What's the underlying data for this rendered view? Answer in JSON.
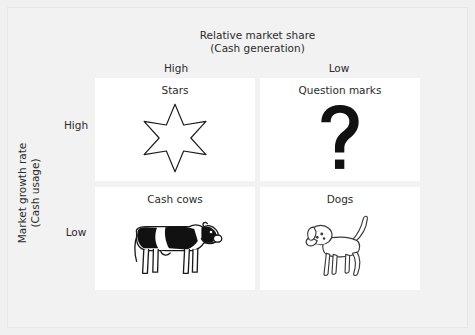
{
  "diagram": {
    "type": "bcg-growth-share-matrix",
    "x_axis": {
      "title_line1": "Relative market share",
      "title_line2": "(Cash generation)",
      "columns": [
        "High",
        "Low"
      ]
    },
    "y_axis": {
      "title_line1": "Market growth rate",
      "title_line2": "(Cash usage)",
      "rows": [
        "High",
        "Low"
      ]
    },
    "quadrants": [
      {
        "label": "Stars",
        "icon": "six-pointed-star-icon",
        "row": "High",
        "column": "High"
      },
      {
        "label": "Question marks",
        "icon": "question-mark-icon",
        "glyph": "?",
        "row": "High",
        "column": "Low"
      },
      {
        "label": "Cash cows",
        "icon": "cow-icon",
        "row": "Low",
        "column": "High"
      },
      {
        "label": "Dogs",
        "icon": "dog-icon",
        "row": "Low",
        "column": "Low"
      }
    ],
    "colors": {
      "background": "#f0f0f0",
      "quadrant_fill": "#ffffff",
      "text": "#2b2b2b",
      "line_art": "#1a1a1a"
    }
  }
}
